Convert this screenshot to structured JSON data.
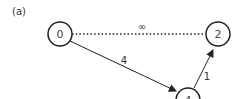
{
  "panel_label": "(a)",
  "nodes": [
    {
      "id": "0",
      "label": "0",
      "cx": 60,
      "cy": 34
    },
    {
      "id": "2",
      "label": "2",
      "cx": 218,
      "cy": 34
    },
    {
      "id": "4",
      "label": "4",
      "cx": 188,
      "cy": 98
    }
  ],
  "edges": [
    {
      "from": "0",
      "to": "2",
      "weight": "∞",
      "style": "dotted"
    },
    {
      "from": "0",
      "to": "4",
      "weight": "4",
      "style": "solid",
      "directed": true
    },
    {
      "from": "4",
      "to": "2",
      "weight": "1",
      "style": "solid",
      "directed": true
    }
  ],
  "colors": {
    "stroke": "#222222",
    "text": "#444444"
  }
}
